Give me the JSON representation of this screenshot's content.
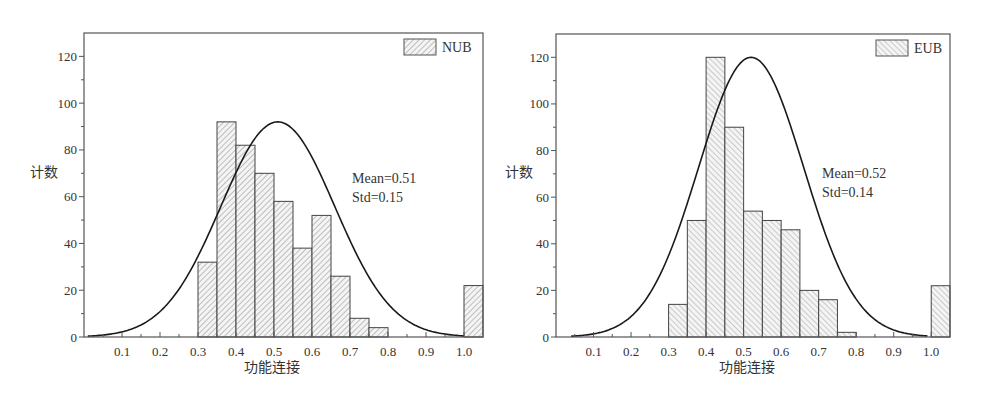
{
  "chart_data": [
    {
      "type": "bar",
      "subtype": "histogram-with-normal-fit",
      "legend": "NUB",
      "legend_position": "top-right",
      "hatch": "forward-diagonal",
      "xlabel": "功能连接",
      "ylabel": "计数",
      "xlim": [
        0,
        1.05
      ],
      "ylim": [
        0,
        130
      ],
      "xticks": [
        "0.1",
        "0.2",
        "0.3",
        "0.4",
        "0.5",
        "0.6",
        "0.7",
        "0.8",
        "0.9",
        "1.0"
      ],
      "yticks": [
        "0",
        "20",
        "40",
        "60",
        "80",
        "100",
        "120"
      ],
      "bin_width": 0.05,
      "bins": [
        {
          "start": 0.3,
          "count": 32
        },
        {
          "start": 0.35,
          "count": 92
        },
        {
          "start": 0.4,
          "count": 82
        },
        {
          "start": 0.45,
          "count": 70
        },
        {
          "start": 0.5,
          "count": 58
        },
        {
          "start": 0.55,
          "count": 38
        },
        {
          "start": 0.6,
          "count": 52
        },
        {
          "start": 0.65,
          "count": 26
        },
        {
          "start": 0.7,
          "count": 8
        },
        {
          "start": 0.75,
          "count": 4
        },
        {
          "start": 1.0,
          "count": 22
        }
      ],
      "fit": {
        "mean": 0.51,
        "std": 0.15,
        "peak": 92,
        "x_start": 0.01,
        "x_end": 1.0
      },
      "annotations": [
        "Mean=0.51",
        "Std=0.15"
      ],
      "grid": false
    },
    {
      "type": "bar",
      "subtype": "histogram-with-normal-fit",
      "legend": "EUB",
      "legend_position": "top-right",
      "hatch": "backward-diagonal",
      "xlabel": "功能连接",
      "ylabel": "计数",
      "xlim": [
        0,
        1.05
      ],
      "ylim": [
        0,
        130
      ],
      "xticks": [
        "0.1",
        "0.2",
        "0.3",
        "0.4",
        "0.5",
        "0.6",
        "0.7",
        "0.8",
        "0.9",
        "1.0"
      ],
      "yticks": [
        "0",
        "20",
        "40",
        "60",
        "80",
        "100",
        "120"
      ],
      "bin_width": 0.05,
      "bins": [
        {
          "start": 0.3,
          "count": 14
        },
        {
          "start": 0.35,
          "count": 50
        },
        {
          "start": 0.4,
          "count": 120
        },
        {
          "start": 0.45,
          "count": 90
        },
        {
          "start": 0.5,
          "count": 54
        },
        {
          "start": 0.55,
          "count": 50
        },
        {
          "start": 0.6,
          "count": 46
        },
        {
          "start": 0.65,
          "count": 20
        },
        {
          "start": 0.7,
          "count": 16
        },
        {
          "start": 0.75,
          "count": 2
        },
        {
          "start": 1.0,
          "count": 22
        }
      ],
      "fit": {
        "mean": 0.52,
        "std": 0.14,
        "peak": 120,
        "x_start": 0.04,
        "x_end": 0.99
      },
      "annotations": [
        "Mean=0.52",
        "Std=0.14"
      ],
      "grid": false
    }
  ]
}
